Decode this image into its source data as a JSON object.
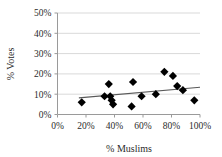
{
  "chart_data": {
    "type": "scatter",
    "title": "",
    "xlabel": "% Muslims",
    "ylabel": "% Votes",
    "xlim": [
      0,
      100
    ],
    "ylim": [
      0,
      50
    ],
    "grid": "horizontal",
    "legend": "none",
    "x_ticks": [
      "0%",
      "20%",
      "40%",
      "60%",
      "80%",
      "100%"
    ],
    "x_tick_values": [
      0,
      20,
      40,
      60,
      80,
      100
    ],
    "y_ticks": [
      "0%",
      "10%",
      "20%",
      "30%",
      "40%",
      "50%"
    ],
    "y_tick_values": [
      0,
      10,
      20,
      30,
      40,
      50
    ],
    "marker": "diamond",
    "marker_color": "#000000",
    "grid_color": "#d9d9d9",
    "axis_color": "#808080",
    "trendline_color": "#595959",
    "points": [
      {
        "x": 17,
        "y": 6
      },
      {
        "x": 33,
        "y": 9
      },
      {
        "x": 36,
        "y": 15
      },
      {
        "x": 37,
        "y": 9
      },
      {
        "x": 38,
        "y": 7
      },
      {
        "x": 39,
        "y": 5
      },
      {
        "x": 52,
        "y": 4
      },
      {
        "x": 53,
        "y": 16
      },
      {
        "x": 59,
        "y": 9
      },
      {
        "x": 69,
        "y": 10
      },
      {
        "x": 75,
        "y": 21
      },
      {
        "x": 81,
        "y": 19
      },
      {
        "x": 84,
        "y": 14
      },
      {
        "x": 88,
        "y": 12
      },
      {
        "x": 96,
        "y": 7
      }
    ],
    "trendline": {
      "x_start": 15,
      "y_start": 8.2,
      "x_end": 100,
      "y_end": 13.4
    }
  }
}
